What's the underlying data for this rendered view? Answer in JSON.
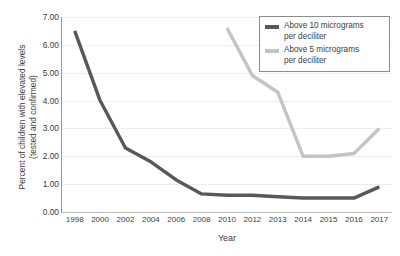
{
  "chart_data": {
    "type": "line",
    "title": "",
    "xlabel": "Year",
    "ylabel": "Percent of children with elevated levels (tested and confirmed)",
    "ylabel_lines": [
      "Percent of children with elevated levels",
      "(tested and confirmed)"
    ],
    "categories": [
      "1998",
      "2000",
      "2002",
      "2004",
      "2006",
      "2008",
      "2010",
      "2012",
      "2013",
      "2014",
      "2015",
      "2016",
      "2017"
    ],
    "x": [
      1998,
      2000,
      2002,
      2004,
      2006,
      2008,
      2010,
      2012,
      2013,
      2014,
      2015,
      2016,
      2017
    ],
    "ylim": [
      0,
      7
    ],
    "ytick_step": 1,
    "yticks": [
      "0.00",
      "1.00",
      "2.00",
      "3.00",
      "4.00",
      "5.00",
      "6.00",
      "7.00"
    ],
    "ytick_values": [
      0,
      1,
      2,
      3,
      4,
      5,
      6,
      7
    ],
    "grid": true,
    "grid_color": "#ededed",
    "legend_position": "top-right",
    "series": [
      {
        "name": "Above 10 micrograms per deciliter",
        "name_lines": [
          "Above 10 micrograms",
          "per deciliter"
        ],
        "color": "#585858",
        "values": [
          6.5,
          4.0,
          2.3,
          1.8,
          1.15,
          0.65,
          0.6,
          0.6,
          0.55,
          0.5,
          0.5,
          0.5,
          0.9
        ]
      },
      {
        "name": "Above 5 micrograms per deciliter",
        "name_lines": [
          "Above 5 micrograms",
          "per deciliter"
        ],
        "color": "#c4c4c4",
        "values": [
          null,
          null,
          null,
          null,
          null,
          null,
          6.6,
          4.9,
          4.3,
          2.0,
          2.0,
          2.1,
          3.0
        ]
      }
    ]
  },
  "axes": {
    "x_title": "Year",
    "y_title_line1": "Percent of children with elevated levels",
    "y_title_line2": "(tested and confirmed)"
  },
  "legend": {
    "items": [
      {
        "line1": "Above 10 micrograms",
        "line2": "per deciliter",
        "color": "#585858"
      },
      {
        "line1": "Above 5 micrograms",
        "line2": "per deciliter",
        "color": "#c4c4c4"
      }
    ]
  },
  "colors": {
    "series_dark": "#585858",
    "series_light": "#c4c4c4",
    "grid": "#ededed",
    "axis": "#9a9a9a",
    "text": "#3c3c3c",
    "legend_border": "#8c8c8c",
    "background": "#ffffff"
  }
}
